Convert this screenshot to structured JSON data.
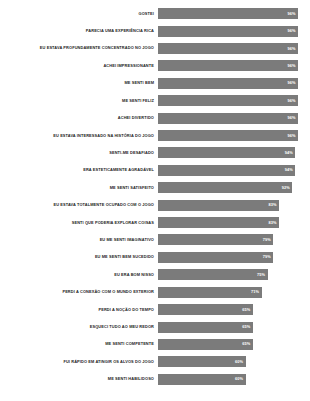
{
  "chart_data": {
    "type": "bar",
    "orientation": "horizontal",
    "title": "",
    "subtitle": "",
    "xlabel": "",
    "ylabel": "",
    "xlim": [
      0,
      100
    ],
    "grid": false,
    "legend": null,
    "bar_color": "#7b7b7b",
    "label_color": "#1c1c1c",
    "value_label_color": "#ffffff",
    "background": "#ffffff",
    "value_suffix": "%",
    "categories": [
      "GOSTEI",
      "PARECIA UMA EXPERIÊNCIA RICA",
      "EU ESTAVA PROFUNDAMENTE CONCENTRADO NO JOGO",
      "ACHEI IMPRESSIONANTE",
      "ME SENTI BEM",
      "ME SENTI FELIZ",
      "ACHEI DIVERTIDO",
      "EU ESTAVA INTERESSADO NA HISTÓRIA DO JOGO",
      "SENTI-ME DESAFIADO",
      "ERA ESTETICAMENTE AGRADÁVEL",
      "ME SENTI SATISFEITO",
      "EU ESTAVA TOTALMENTE OCUPADO COM O JOGO",
      "SENTI QUE PODERIA EXPLORAR COISAS",
      "EU ME SENTI IMAGINATIVO",
      "EU ME SENTI BEM SUCEDIDO",
      "EU ERA BOM NISSO",
      "PERDI A CONEXÃO COM O MUNDO EXTERIOR",
      "PERDI A NOÇÃO DO TEMPO",
      "ESQUECI TUDO AO MEU REDOR",
      "ME SENTI COMPETENTE",
      "FUI RÁPIDO EM ATINGIR OS ALVOS DO JOGO",
      "ME SENTI HABILIDOSO"
    ],
    "values": [
      96,
      96,
      96,
      96,
      96,
      96,
      96,
      96,
      94,
      94,
      92,
      83,
      83,
      79,
      79,
      75,
      71,
      65,
      65,
      65,
      60,
      60
    ],
    "value_labels": [
      "96%",
      "96%",
      "96%",
      "96%",
      "96%",
      "96%",
      "96%",
      "96%",
      "94%",
      "94%",
      "92%",
      "83%",
      "83%",
      "79%",
      "79%",
      "75%",
      "71%",
      "65%",
      "65%",
      "65%",
      "60%",
      "60%"
    ]
  },
  "caption": {
    "text": ""
  }
}
